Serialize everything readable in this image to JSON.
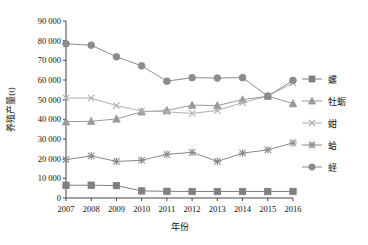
{
  "chart_data": {
    "type": "line",
    "title": "",
    "xlabel": "年份",
    "ylabel": "养殖产量(t)",
    "categories": [
      "2007",
      "2008",
      "2009",
      "2010",
      "2011",
      "2012",
      "2013",
      "2014",
      "2015",
      "2016"
    ],
    "x": [
      2007,
      2008,
      2009,
      2010,
      2011,
      2012,
      2013,
      2014,
      2015,
      2016
    ],
    "xlim": [
      2007,
      2016
    ],
    "ylim": [
      0,
      90000
    ],
    "yticks": [
      0,
      10000,
      20000,
      30000,
      40000,
      50000,
      60000,
      70000,
      80000,
      90000
    ],
    "ytick_labels": [
      "0",
      "10 000",
      "20 000",
      "30 000",
      "40 000",
      "50 000",
      "60 000",
      "70 000",
      "80 000",
      "90 000"
    ],
    "xticks": [
      2007,
      2008,
      2009,
      2010,
      2011,
      2012,
      2013,
      2014,
      2015,
      2016
    ],
    "xtick_labels": [
      "2007",
      "2008",
      "2009",
      "2010",
      "2011",
      "2012",
      "2013",
      "2014",
      "2015",
      "2016"
    ],
    "grid": false,
    "legend_position": "right",
    "series": [
      {
        "name": "螺",
        "marker": "square",
        "color": "#808080",
        "values": [
          6500,
          6500,
          6300,
          3600,
          3400,
          3300,
          3300,
          3300,
          3300,
          3300
        ]
      },
      {
        "name": "牡蛎",
        "marker": "triangle",
        "color": "#9a9a9a",
        "values": [
          38800,
          39000,
          40200,
          43800,
          44500,
          47200,
          47000,
          50000,
          51800,
          48000
        ]
      },
      {
        "name": "蚶",
        "marker": "x",
        "color": "#b0b0b0",
        "values": [
          50800,
          50800,
          47000,
          44200,
          43800,
          43000,
          44500,
          48500,
          51800,
          58500
        ]
      },
      {
        "name": "蛤",
        "marker": "asterisk",
        "color": "#8a8a8a",
        "values": [
          19500,
          21400,
          18600,
          19200,
          22200,
          23200,
          18600,
          22800,
          24500,
          28000
        ]
      },
      {
        "name": "蛏",
        "marker": "circle",
        "color": "#8c8c8c",
        "values": [
          78400,
          77700,
          71800,
          67200,
          59400,
          61200,
          61000,
          61200,
          51800,
          59800
        ]
      }
    ]
  },
  "legend": {
    "items": [
      {
        "label": "螺"
      },
      {
        "label": "牡蛎"
      },
      {
        "label": "蚶"
      },
      {
        "label": "蛤"
      },
      {
        "label": "蛏"
      }
    ]
  },
  "colors": {
    "axis": "#444444",
    "text": "#111111",
    "background": "#ffffff"
  }
}
